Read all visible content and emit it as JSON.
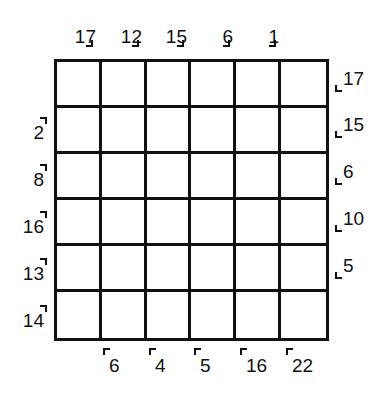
{
  "puzzle": {
    "rows": 6,
    "cols": 6,
    "top_clues": [
      "17",
      "12",
      "15",
      "6",
      "1"
    ],
    "left_clues": [
      "2",
      "8",
      "16",
      "13",
      "14"
    ],
    "right_clues": [
      "17",
      "15",
      "6",
      "10",
      "5"
    ],
    "bottom_clues": [
      "6",
      "4",
      "5",
      "16",
      "22"
    ]
  }
}
